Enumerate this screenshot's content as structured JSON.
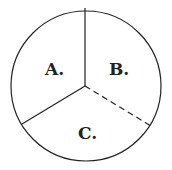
{
  "diagram": {
    "type": "circle-divided-three-sectors",
    "sectors": [
      {
        "label": "A."
      },
      {
        "label": "B."
      },
      {
        "label": "C."
      }
    ],
    "divider_styles": {
      "top": "solid",
      "lower_left": "solid",
      "lower_right": "dashed"
    },
    "stroke_color": "#222222"
  }
}
